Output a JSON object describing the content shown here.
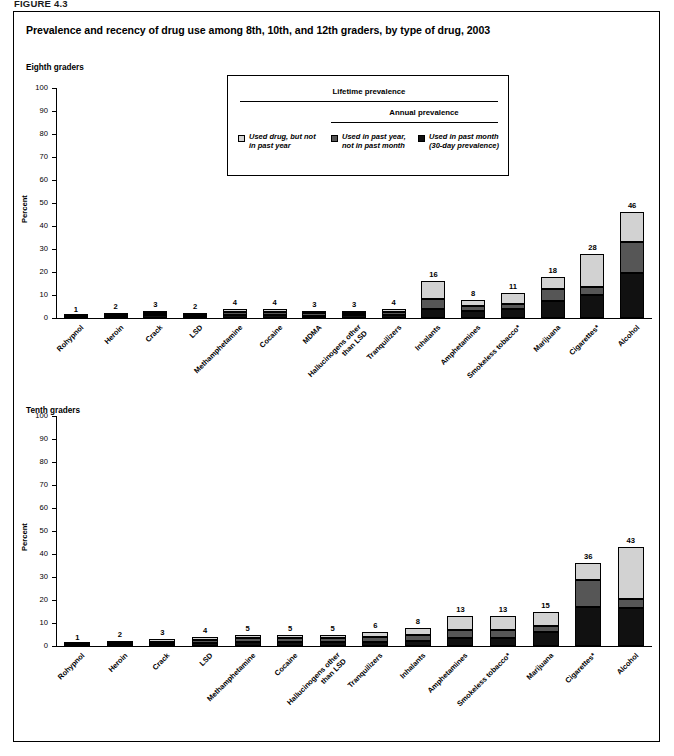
{
  "figure_number": "FIGURE 4.3",
  "title": "Prevalence and recency of drug use among 8th, 10th, and 12th graders, by type of drug, 2003",
  "legend": {
    "lifetime_header": "Lifetime prevalence",
    "annual_header": "Annual prevalence",
    "items": [
      {
        "swatch": "s1",
        "line1": "Used drug, but not",
        "line2": "in past year"
      },
      {
        "swatch": "s2",
        "line1": "Used in past year,",
        "line2": "not in past month"
      },
      {
        "swatch": "s3",
        "line1": "Used in past month",
        "line2": "(30-day prevalence)"
      }
    ]
  },
  "colors": {
    "lifetime_not_past_year": "#d2d2d2",
    "past_year_not_past_month": "#565656",
    "past_month": "#111111",
    "axis": "#000000",
    "background": "#ffffff"
  },
  "panels": [
    {
      "id": "eighth",
      "label": "Eighth graders"
    },
    {
      "id": "tenth",
      "label": "Tenth graders"
    }
  ],
  "chart_data": [
    {
      "type": "bar",
      "subtype": "stacked",
      "title": "Eighth graders",
      "xlabel": "",
      "ylabel": "Percent",
      "ylim": [
        0,
        100
      ],
      "yticks": [
        0,
        10,
        20,
        30,
        40,
        50,
        60,
        70,
        80,
        90,
        100
      ],
      "grid": false,
      "legend_position": "top-center",
      "categories": [
        "Rohypnol",
        "Heroin",
        "Crack",
        "LSD",
        "Methamphetamine",
        "Cocaine",
        "MDMA",
        "Hallucinogens other than LSD",
        "Tranquilizers",
        "Inhalants",
        "Amphetamines",
        "Smokeless tobacco*",
        "Marijuana",
        "Cigarettes*",
        "Alcohol"
      ],
      "totals": [
        1,
        2,
        3,
        2,
        4,
        4,
        3,
        3,
        4,
        16,
        8,
        11,
        18,
        28,
        46
      ],
      "series": [
        {
          "name": "Used in past month (30-day prevalence)",
          "key": "s3",
          "values": [
            0.4,
            0.8,
            1.2,
            0.8,
            1.5,
            1.4,
            1.0,
            1.1,
            1.4,
            4.1,
            2.9,
            4.1,
            7.5,
            10.2,
            19.7
          ]
        },
        {
          "name": "Used in past year, not in past month",
          "key": "s2",
          "values": [
            0.3,
            0.7,
            0.9,
            0.6,
            1.3,
            1.1,
            1.0,
            1.0,
            1.2,
            4.0,
            2.3,
            1.9,
            5.0,
            3.5,
            13.5
          ]
        },
        {
          "name": "Used drug, but not in past year",
          "key": "s1",
          "values": [
            0.3,
            0.5,
            0.9,
            0.6,
            1.2,
            1.5,
            1.0,
            0.9,
            1.4,
            7.9,
            2.8,
            5.0,
            5.5,
            14.3,
            12.8
          ]
        }
      ]
    },
    {
      "type": "bar",
      "subtype": "stacked",
      "title": "Tenth graders",
      "xlabel": "",
      "ylabel": "Percent",
      "ylim": [
        0,
        100
      ],
      "yticks": [
        0,
        10,
        20,
        30,
        40,
        50,
        60,
        70,
        80,
        90,
        100
      ],
      "grid": false,
      "legend_position": "none",
      "categories": [
        "Rohypnol",
        "Heroin",
        "Crack",
        "LSD",
        "Methamphetamine",
        "Cocaine",
        "Hallucinogens other than LSD",
        "Tranquilizers",
        "Inhalants",
        "Amphetamines",
        "Smokeless tobacco*",
        "Marijuana",
        "Cigarettes*",
        "Alcohol"
      ],
      "totals": [
        1,
        2,
        3,
        4,
        5,
        5,
        5,
        6,
        8,
        13,
        13,
        15,
        36,
        43,
        66
      ],
      "series": [
        {
          "name": "Used in past month (30-day prevalence)",
          "key": "s3",
          "values": [
            0.4,
            0.9,
            1.0,
            1.2,
            1.8,
            1.8,
            1.6,
            1.9,
            2.2,
            3.6,
            3.5,
            6.1,
            17.0,
            16.7,
            35.4
          ]
        },
        {
          "name": "Used in past year, not in past month",
          "key": "s2",
          "values": [
            0.3,
            0.6,
            0.9,
            1.3,
            1.7,
            1.6,
            1.8,
            2.1,
            2.6,
            3.4,
            3.3,
            2.6,
            11.8,
            3.8,
            24.6
          ]
        },
        {
          "name": "Used drug, but not in past year",
          "key": "s1",
          "values": [
            0.3,
            0.5,
            1.1,
            1.5,
            1.5,
            1.6,
            1.6,
            2.0,
            3.2,
            6.0,
            6.2,
            6.3,
            7.2,
            22.5,
            6.0
          ]
        }
      ]
    }
  ]
}
